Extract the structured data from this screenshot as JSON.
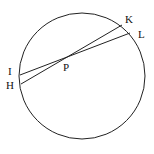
{
  "diagram": {
    "type": "circle-intersecting-chords",
    "circle": {
      "cx": 82,
      "cy": 76,
      "r": 63
    },
    "stroke_color": "#222222",
    "points": {
      "I": {
        "label": "I",
        "x": 20,
        "y": 75
      },
      "H": {
        "label": "H",
        "x": 21,
        "y": 84
      },
      "K": {
        "label": "K",
        "x": 122,
        "y": 25
      },
      "L": {
        "label": "L",
        "x": 130,
        "y": 33
      },
      "P": {
        "label": "P",
        "x": 68,
        "y": 57
      }
    },
    "chords": [
      [
        "I",
        "L"
      ],
      [
        "H",
        "K"
      ]
    ]
  }
}
